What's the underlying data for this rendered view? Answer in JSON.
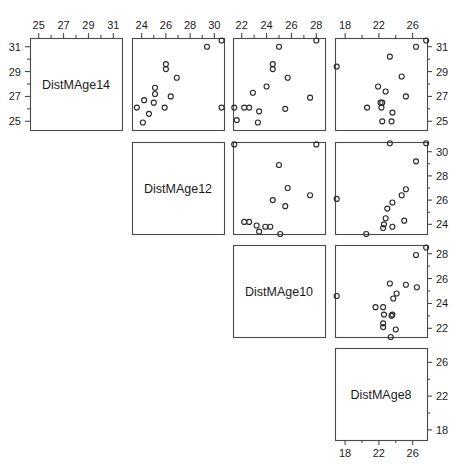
{
  "chart_data": {
    "type": "scatter",
    "title": "",
    "subtitle": "",
    "plot_kind": "scatterplot-matrix",
    "grid": false,
    "legend": null,
    "variables": [
      {
        "name": "DistMAge14",
        "index": 0,
        "lim": [
          24.3,
          31.7
        ],
        "ticks": [
          25,
          27,
          29,
          31
        ],
        "minor_ticks": [
          26,
          28,
          30
        ]
      },
      {
        "name": "DistMAge12",
        "index": 1,
        "lim": [
          23.2,
          30.8
        ],
        "ticks": [
          24,
          26,
          28,
          30
        ],
        "minor_ticks": [
          25,
          27,
          29
        ]
      },
      {
        "name": "DistMAge10",
        "index": 2,
        "lim": [
          21.3,
          28.7
        ],
        "ticks": [
          22,
          24,
          26,
          28
        ],
        "minor_ticks": [
          23,
          25,
          27
        ]
      },
      {
        "name": "DistMAge8",
        "index": 3,
        "lim": [
          16.8,
          27.7
        ],
        "ticks": [
          18,
          22,
          26
        ],
        "minor_ticks": [
          20,
          24
        ]
      }
    ],
    "observations": [
      {
        "DistMAge8": 21.0,
        "DistMAge10": 20.0,
        "DistMAge12": 21.5,
        "DistMAge14": 23.0
      },
      {
        "DistMAge8": 21.0,
        "DistMAge10": 21.5,
        "DistMAge12": 24.0,
        "DistMAge14": 25.5
      },
      {
        "DistMAge8": 20.5,
        "DistMAge10": 24.0,
        "DistMAge12": 24.5,
        "DistMAge14": 26.0
      },
      {
        "DistMAge8": 23.5,
        "DistMAge10": 24.5,
        "DistMAge12": 25.0,
        "DistMAge14": 26.5
      },
      {
        "DistMAge8": 21.5,
        "DistMAge10": 23.0,
        "DistMAge12": 22.5,
        "DistMAge14": 23.5
      },
      {
        "DistMAge8": 20.0,
        "DistMAge10": 21.0,
        "DistMAge12": 21.0,
        "DistMAge14": 22.5
      },
      {
        "DistMAge8": 21.5,
        "DistMAge10": 22.5,
        "DistMAge12": 23.0,
        "DistMAge14": 25.0
      },
      {
        "DistMAge8": 23.0,
        "DistMAge10": 23.0,
        "DistMAge12": 23.5,
        "DistMAge14": 24.0
      },
      {
        "DistMAge8": 20.0,
        "DistMAge10": 21.0,
        "DistMAge12": 22.0,
        "DistMAge14": 21.5
      },
      {
        "DistMAge8": 16.5,
        "DistMAge10": 19.0,
        "DistMAge12": 19.0,
        "DistMAge14": 19.5
      },
      {
        "DistMAge8": 24.5,
        "DistMAge10": 25.0,
        "DistMAge12": 28.0,
        "DistMAge14": 28.0
      }
    ],
    "panels": [
      {
        "row": 0,
        "col": 0,
        "kind": "diagonal",
        "label": "DistMAge14",
        "axis_top": {
          "var": "DistMAge14",
          "ticks": [
            25,
            27,
            29,
            31
          ]
        },
        "axis_left": {
          "var": "DistMAge14",
          "ticks": [
            25,
            27,
            29,
            31
          ]
        }
      },
      {
        "row": 0,
        "col": 1,
        "kind": "scatter",
        "x_var": "DistMAge12",
        "y_var": "DistMAge14",
        "axis_top": {
          "var": "DistMAge12",
          "ticks": [
            24,
            26,
            28,
            30
          ]
        },
        "points": [
          {
            "x": 29.4,
            "y": 31.0
          },
          {
            "x": 30.6,
            "y": 31.5
          },
          {
            "x": 26.0,
            "y": 29.6
          },
          {
            "x": 26.0,
            "y": 29.2
          },
          {
            "x": 26.9,
            "y": 28.5
          },
          {
            "x": 25.1,
            "y": 27.7
          },
          {
            "x": 25.1,
            "y": 27.2
          },
          {
            "x": 26.4,
            "y": 27.0
          },
          {
            "x": 24.2,
            "y": 26.7
          },
          {
            "x": 23.6,
            "y": 26.1
          },
          {
            "x": 25.0,
            "y": 26.5
          },
          {
            "x": 25.9,
            "y": 26.1
          },
          {
            "x": 30.6,
            "y": 26.1
          },
          {
            "x": 24.6,
            "y": 25.6
          },
          {
            "x": 24.1,
            "y": 24.9
          }
        ]
      },
      {
        "row": 0,
        "col": 2,
        "kind": "scatter",
        "x_var": "DistMAge10",
        "y_var": "DistMAge14",
        "axis_top": {
          "var": "DistMAge10",
          "ticks": [
            22,
            24,
            26,
            28
          ]
        },
        "points": [
          {
            "x": 25.0,
            "y": 31.0
          },
          {
            "x": 28.0,
            "y": 31.5
          },
          {
            "x": 24.5,
            "y": 29.6
          },
          {
            "x": 24.5,
            "y": 29.2
          },
          {
            "x": 25.7,
            "y": 28.5
          },
          {
            "x": 24.0,
            "y": 27.8
          },
          {
            "x": 22.9,
            "y": 27.3
          },
          {
            "x": 27.5,
            "y": 26.9
          },
          {
            "x": 22.2,
            "y": 26.1
          },
          {
            "x": 22.6,
            "y": 26.1
          },
          {
            "x": 21.4,
            "y": 26.1
          },
          {
            "x": 23.4,
            "y": 25.8
          },
          {
            "x": 25.5,
            "y": 26.0
          },
          {
            "x": 21.6,
            "y": 25.1
          },
          {
            "x": 23.3,
            "y": 24.9
          }
        ]
      },
      {
        "row": 0,
        "col": 3,
        "kind": "scatter",
        "x_var": "DistMAge8",
        "y_var": "DistMAge14",
        "axis_top": {
          "var": "DistMAge8",
          "ticks": [
            18,
            22,
            26
          ]
        },
        "axis_right": {
          "var": "DistMAge14",
          "ticks": [
            25,
            27,
            29,
            31
          ]
        },
        "points": [
          {
            "x": 26.4,
            "y": 31.0
          },
          {
            "x": 27.6,
            "y": 31.5
          },
          {
            "x": 23.3,
            "y": 30.2
          },
          {
            "x": 17.0,
            "y": 29.4
          },
          {
            "x": 24.7,
            "y": 28.6
          },
          {
            "x": 21.9,
            "y": 27.8
          },
          {
            "x": 22.8,
            "y": 27.4
          },
          {
            "x": 25.2,
            "y": 27.0
          },
          {
            "x": 22.2,
            "y": 26.5
          },
          {
            "x": 22.4,
            "y": 26.5
          },
          {
            "x": 22.3,
            "y": 26.1
          },
          {
            "x": 20.6,
            "y": 26.1
          },
          {
            "x": 23.6,
            "y": 25.7
          },
          {
            "x": 22.4,
            "y": 25.0
          },
          {
            "x": 23.5,
            "y": 25.0
          }
        ]
      },
      {
        "row": 1,
        "col": 1,
        "kind": "diagonal",
        "label": "DistMAge12"
      },
      {
        "row": 1,
        "col": 2,
        "kind": "scatter",
        "x_var": "DistMAge10",
        "y_var": "DistMAge12",
        "points": [
          {
            "x": 21.4,
            "y": 30.6
          },
          {
            "x": 28.0,
            "y": 30.6
          },
          {
            "x": 25.0,
            "y": 28.9
          },
          {
            "x": 25.7,
            "y": 27.0
          },
          {
            "x": 27.5,
            "y": 26.4
          },
          {
            "x": 24.5,
            "y": 26.0
          },
          {
            "x": 25.5,
            "y": 25.5
          },
          {
            "x": 22.2,
            "y": 24.2
          },
          {
            "x": 22.6,
            "y": 24.2
          },
          {
            "x": 23.2,
            "y": 23.9
          },
          {
            "x": 23.9,
            "y": 23.8
          },
          {
            "x": 24.3,
            "y": 23.8
          },
          {
            "x": 23.4,
            "y": 23.4
          },
          {
            "x": 25.1,
            "y": 23.2
          }
        ]
      },
      {
        "row": 1,
        "col": 3,
        "kind": "scatter",
        "x_var": "DistMAge8",
        "y_var": "DistMAge12",
        "axis_right": {
          "var": "DistMAge12",
          "ticks": [
            24,
            26,
            28,
            30
          ]
        },
        "points": [
          {
            "x": 23.3,
            "y": 30.7
          },
          {
            "x": 27.6,
            "y": 30.7
          },
          {
            "x": 26.4,
            "y": 29.2
          },
          {
            "x": 17.0,
            "y": 26.1
          },
          {
            "x": 25.2,
            "y": 26.9
          },
          {
            "x": 24.7,
            "y": 26.4
          },
          {
            "x": 23.6,
            "y": 25.8
          },
          {
            "x": 23.0,
            "y": 25.3
          },
          {
            "x": 22.8,
            "y": 24.5
          },
          {
            "x": 25.0,
            "y": 24.3
          },
          {
            "x": 22.6,
            "y": 24.0
          },
          {
            "x": 22.5,
            "y": 23.7
          },
          {
            "x": 23.6,
            "y": 23.8
          },
          {
            "x": 20.5,
            "y": 23.2
          }
        ]
      },
      {
        "row": 2,
        "col": 2,
        "kind": "diagonal",
        "label": "DistMAge10"
      },
      {
        "row": 2,
        "col": 3,
        "kind": "scatter",
        "x_var": "DistMAge8",
        "y_var": "DistMAge10",
        "axis_right": {
          "var": "DistMAge10",
          "ticks": [
            22,
            24,
            26,
            28
          ]
        },
        "points": [
          {
            "x": 27.6,
            "y": 28.5
          },
          {
            "x": 26.4,
            "y": 27.9
          },
          {
            "x": 23.3,
            "y": 25.6
          },
          {
            "x": 25.2,
            "y": 25.5
          },
          {
            "x": 26.5,
            "y": 25.3
          },
          {
            "x": 24.1,
            "y": 24.8
          },
          {
            "x": 17.0,
            "y": 24.6
          },
          {
            "x": 23.7,
            "y": 24.4
          },
          {
            "x": 21.6,
            "y": 23.7
          },
          {
            "x": 22.5,
            "y": 23.7
          },
          {
            "x": 22.6,
            "y": 23.1
          },
          {
            "x": 23.6,
            "y": 23.1
          },
          {
            "x": 23.5,
            "y": 23.0
          },
          {
            "x": 22.5,
            "y": 22.4
          },
          {
            "x": 22.5,
            "y": 22.1
          },
          {
            "x": 24.0,
            "y": 21.9
          },
          {
            "x": 23.4,
            "y": 21.3
          }
        ]
      },
      {
        "row": 3,
        "col": 3,
        "kind": "diagonal",
        "label": "DistMAge8",
        "axis_right": {
          "var": "DistMAge8",
          "ticks": [
            18,
            22,
            26
          ]
        },
        "axis_bottom": {
          "var": "DistMAge8",
          "ticks": [
            18,
            22,
            26
          ]
        }
      }
    ]
  }
}
